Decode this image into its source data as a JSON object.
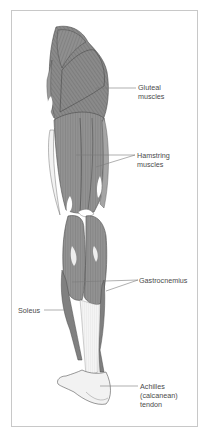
{
  "figure": {
    "colors": {
      "muscle": "#8e8e8e",
      "muscle_dark": "#5a5a5a",
      "tendon": "#eeeeee",
      "outline": "#3f3f3f",
      "leader": "#7a7a7a",
      "frame": "#c8c8c8",
      "text": "#4a4a4a"
    },
    "labels": [
      {
        "id": "gluteal",
        "text": "Gluteal\nmuscles"
      },
      {
        "id": "hamstring",
        "text": "Hamstring\nmuscles"
      },
      {
        "id": "gastrocnemius",
        "text": "Gastrocnemius"
      },
      {
        "id": "soleus",
        "text": "Soleus"
      },
      {
        "id": "achilles",
        "text": "Achilles\n(calcanean)\ntendon"
      }
    ]
  }
}
